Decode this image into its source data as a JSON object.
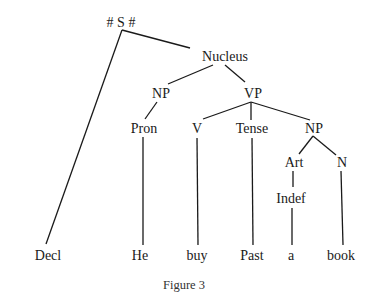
{
  "figure": {
    "caption": "Figure 3",
    "type": "syntax-tree"
  },
  "tree": {
    "nodes": {
      "S": {
        "label": "# S #",
        "x": 121,
        "y": 27
      },
      "Nucleus": {
        "label": "Nucleus",
        "x": 225,
        "y": 61
      },
      "NP1": {
        "label": "NP",
        "x": 161,
        "y": 98
      },
      "VP": {
        "label": "VP",
        "x": 253,
        "y": 98
      },
      "Pron": {
        "label": "Pron",
        "x": 144,
        "y": 133
      },
      "V": {
        "label": "V",
        "x": 197,
        "y": 133
      },
      "Tense": {
        "label": "Tense",
        "x": 252,
        "y": 133
      },
      "NP2": {
        "label": "NP",
        "x": 314,
        "y": 133
      },
      "Art": {
        "label": "Art",
        "x": 294,
        "y": 167
      },
      "N": {
        "label": "N",
        "x": 342,
        "y": 167
      },
      "Indef": {
        "label": "Indef",
        "x": 291,
        "y": 203
      },
      "Decl": {
        "label": "Decl",
        "x": 48,
        "y": 260
      },
      "He": {
        "label": "He",
        "x": 140,
        "y": 260
      },
      "buy": {
        "label": "buy",
        "x": 197,
        "y": 260
      },
      "Past": {
        "label": "Past",
        "x": 252,
        "y": 260
      },
      "a": {
        "label": "a",
        "x": 291,
        "y": 260
      },
      "book": {
        "label": "book",
        "x": 341,
        "y": 260
      }
    },
    "edges": [
      [
        "S",
        "Decl"
      ],
      [
        "S",
        "Nucleus"
      ],
      [
        "Nucleus",
        "NP1"
      ],
      [
        "Nucleus",
        "VP"
      ],
      [
        "NP1",
        "Pron"
      ],
      [
        "Pron",
        "He"
      ],
      [
        "VP",
        "V"
      ],
      [
        "VP",
        "Tense"
      ],
      [
        "VP",
        "NP2"
      ],
      [
        "V",
        "buy"
      ],
      [
        "Tense",
        "Past"
      ],
      [
        "NP2",
        "Art"
      ],
      [
        "NP2",
        "N"
      ],
      [
        "Art",
        "Indef"
      ],
      [
        "Indef",
        "a"
      ],
      [
        "N",
        "book"
      ]
    ]
  }
}
